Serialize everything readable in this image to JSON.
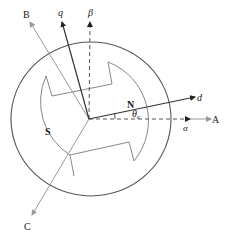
{
  "diagram": {
    "labels": {
      "A": "A",
      "B": "B",
      "C": "C",
      "alpha": "α",
      "beta": "β",
      "d": "d",
      "q": "q",
      "north_pole": "N",
      "south_pole": "S",
      "theta": "θ",
      "theta_sub": "e"
    },
    "colors": {
      "stator_outline": "#555555",
      "rotor_outline": "#888888",
      "dq_axes": "#333333",
      "abc_axes": "#999999",
      "alphabeta_axes": "#555555"
    }
  }
}
